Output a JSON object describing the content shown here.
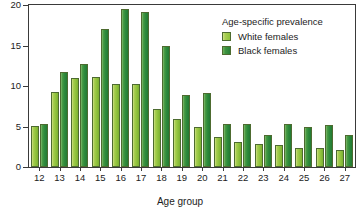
{
  "chart_data": {
    "type": "bar",
    "title": "",
    "xlabel": "Age group",
    "ylabel": "",
    "ylim": [
      0,
      20
    ],
    "yticks": [
      0,
      5,
      10,
      15,
      20
    ],
    "grid": false,
    "legend_position": "top-right",
    "legend_title": "Age-specific prevalence",
    "categories": [
      "12",
      "13",
      "14",
      "15",
      "16",
      "17",
      "18",
      "19",
      "20",
      "21",
      "22",
      "23",
      "24",
      "25",
      "26",
      "27"
    ],
    "series": [
      {
        "name": "White females",
        "color": "#9ecb46",
        "values": [
          5.1,
          9.2,
          11.0,
          11.1,
          10.3,
          10.3,
          7.2,
          5.9,
          4.9,
          3.7,
          3.1,
          2.9,
          2.7,
          2.3,
          2.3,
          2.1
        ]
      },
      {
        "name": "Black females",
        "color": "#2f8b3c",
        "values": [
          5.3,
          11.7,
          12.7,
          17.1,
          19.5,
          19.1,
          14.9,
          8.9,
          9.1,
          5.3,
          5.3,
          4.0,
          5.3,
          5.0,
          5.2,
          4.0
        ]
      }
    ]
  },
  "axes": {
    "x_title": "Age group"
  },
  "legend": {
    "title": "Age-specific prevalence",
    "entries": [
      {
        "label": "White females",
        "swatch": "white-f"
      },
      {
        "label": "Black females",
        "swatch": "black-f"
      }
    ]
  }
}
